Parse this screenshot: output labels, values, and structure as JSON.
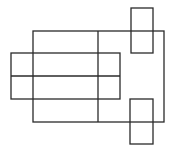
{
  "diagram": {
    "stroke_color": "#2a2a2a",
    "background": "#ffffff",
    "shapes": [
      {
        "name": "main-rectangle",
        "x": 33,
        "y": 31,
        "w": 131,
        "h": 91
      },
      {
        "name": "main-divider",
        "x1": 98,
        "y1": 31,
        "x2": 98,
        "y2": 122
      },
      {
        "name": "left-rectangle",
        "x": 11,
        "y": 53,
        "w": 109,
        "h": 46
      },
      {
        "name": "left-divider",
        "x1": 11,
        "y1": 76,
        "x2": 120,
        "y2": 76
      },
      {
        "name": "top-right-rectangle",
        "x": 131,
        "y": 8,
        "w": 22,
        "h": 45
      },
      {
        "name": "bottom-right-rectangle",
        "x": 130,
        "y": 99,
        "w": 23,
        "h": 45
      }
    ]
  }
}
